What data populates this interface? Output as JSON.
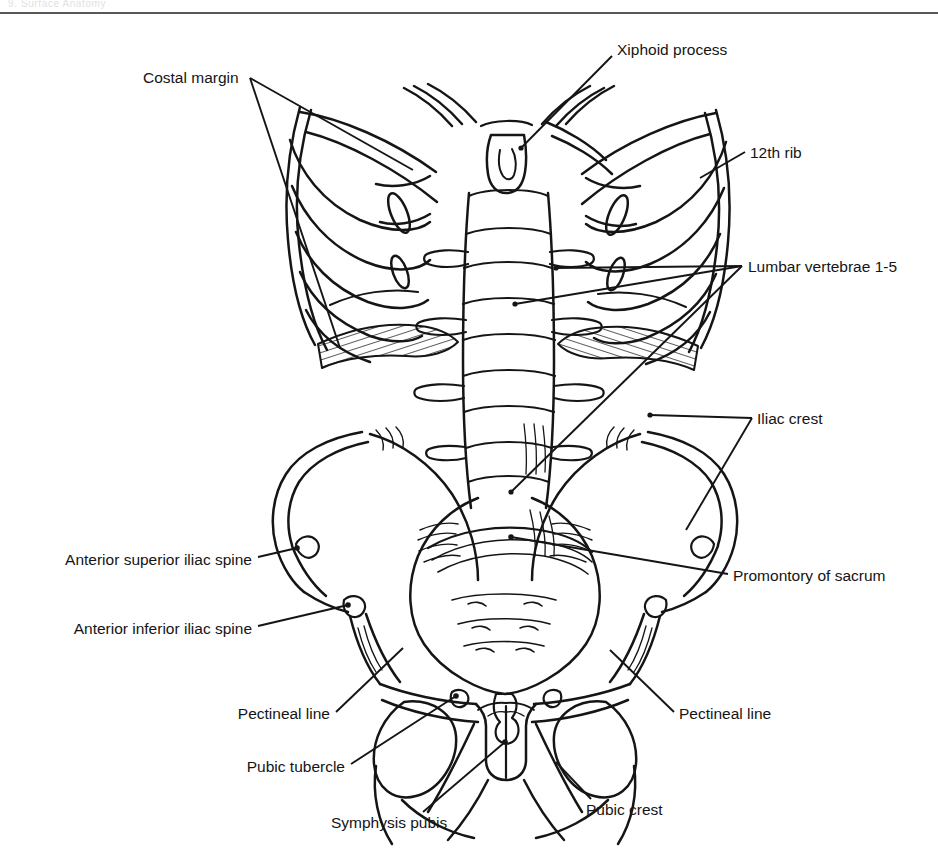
{
  "page": {
    "header_text": "9.  Surface Anatomy",
    "background_color": "#ffffff",
    "ink_color": "#151515",
    "rule_color": "#585858",
    "width": 938,
    "height": 860
  },
  "figure": {
    "view": "anterior",
    "style": "line drawing"
  },
  "labels": [
    {
      "id": "costal-margin",
      "text": "Costal margin",
      "x": 143,
      "y": 78,
      "align": "left",
      "leaders": 2
    },
    {
      "id": "xiphoid-process",
      "text": "Xiphoid process",
      "x": 617,
      "y": 50,
      "align": "left",
      "leaders": 1
    },
    {
      "id": "twelfth-rib",
      "text": "12th rib",
      "x": 750,
      "y": 153,
      "align": "left",
      "leaders": 1
    },
    {
      "id": "lumbar-vertebrae",
      "text": "Lumbar vertebrae 1-5",
      "x": 748,
      "y": 268,
      "align": "left",
      "leaders": 2
    },
    {
      "id": "iliac-crest",
      "text": "Iliac crest",
      "x": 757,
      "y": 420,
      "align": "left",
      "leaders": 2
    },
    {
      "id": "promontory-of-sacrum",
      "text": "Promontory of sacrum",
      "x": 733,
      "y": 578,
      "align": "left",
      "leaders": 1
    },
    {
      "id": "pectineal-line-right",
      "text": "Pectineal line",
      "x": 679,
      "y": 716,
      "align": "left",
      "leaders": 1
    },
    {
      "id": "anterior-superior-iliac-spine",
      "text": "Anterior superior iliac spine",
      "x": 252,
      "y": 562,
      "align": "right",
      "leaders": 1
    },
    {
      "id": "anterior-inferior-iliac-spine",
      "text": "Anterior  inferior iliac spine",
      "x": 252,
      "y": 631,
      "align": "right",
      "leaders": 1
    },
    {
      "id": "pectineal-line-left",
      "text": "Pectineal line",
      "x": 330,
      "y": 716,
      "align": "right",
      "leaders": 1
    },
    {
      "id": "pubic-tubercle",
      "text": "Pubic tubercle",
      "x": 345,
      "y": 769,
      "align": "right",
      "leaders": 1
    },
    {
      "id": "symphysis-pubis",
      "text": "Symphysis pubis",
      "x": 331,
      "y": 825,
      "align": "left",
      "leaders": 1
    },
    {
      "id": "pubic-crest",
      "text": "Pubic crest",
      "x": 586,
      "y": 812,
      "align": "left",
      "leaders": 1
    }
  ]
}
